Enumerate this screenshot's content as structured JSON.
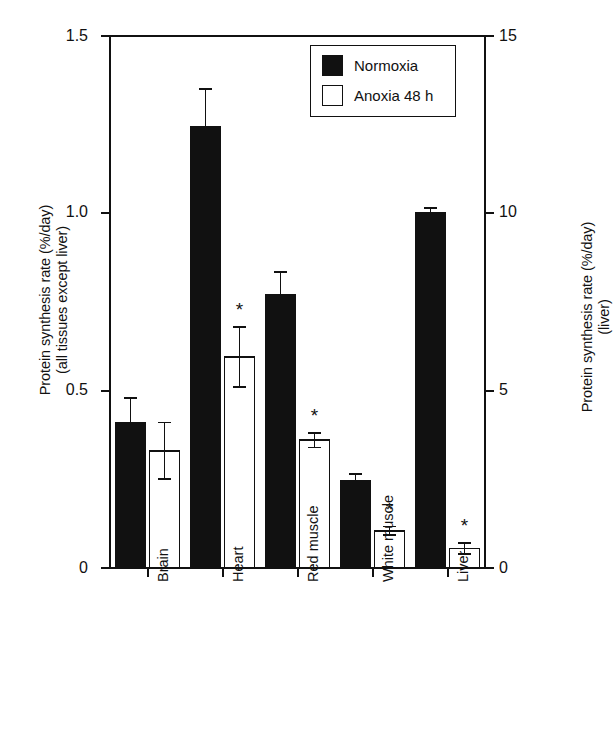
{
  "chart_data": {
    "type": "bar",
    "title": "",
    "categories": [
      "Brain",
      "Heart",
      "Red muscle",
      "White muscle",
      "Liver"
    ],
    "series": [
      {
        "name": "Normoxia",
        "color": "#111111",
        "fill": "solid",
        "values": [
          0.41,
          1.245,
          0.77,
          0.245,
          1.0
        ],
        "errors": [
          0.07,
          0.105,
          0.065,
          0.02,
          0.015
        ],
        "significant": [
          false,
          false,
          false,
          false,
          false
        ]
      },
      {
        "name": "Anoxia 48 h",
        "color": "#ffffff",
        "fill": "open",
        "values": [
          0.33,
          0.595,
          0.36,
          0.105,
          0.055
        ],
        "errors": [
          0.08,
          0.085,
          0.02,
          0.012,
          0.015
        ],
        "significant": [
          false,
          true,
          true,
          true,
          true
        ]
      }
    ],
    "ylabel": "Protein synthesis rate (%/day) (all tissues except liver)",
    "ylabel_line1": "Protein synthesis rate (%/day)",
    "ylabel_line2": "(all tissues except liver)",
    "ylabel_right": "Protein synthesis rate (%/day) (liver)",
    "ylabel_right_line1": "Protein synthesis rate (%/day)",
    "ylabel_right_line2": "(liver)",
    "xlabel": "",
    "ylim": [
      0,
      1.5
    ],
    "yticks": [
      0,
      0.5,
      1.0,
      1.5
    ],
    "ytick_labels": [
      "0",
      "0.5",
      "1.0",
      "1.5"
    ],
    "ylim_right": [
      0,
      15
    ],
    "yticks_right": [
      0,
      5,
      10,
      15
    ],
    "ytick_labels_right": [
      "0",
      "5",
      "10",
      "15"
    ],
    "grid": false,
    "legend_position": "top-right",
    "significance_marker": "*",
    "error_bar_type": "symmetric",
    "liver_scale_factor": 10,
    "note": "Liver bars are plotted on the right-hand axis (0-15 %/day); all other tissues use the left-hand axis (0-1.5 %/day)."
  },
  "legend": {
    "items": [
      {
        "label": "Normoxia",
        "swatch": "filled-square-icon"
      },
      {
        "label": "Anoxia 48 h",
        "swatch": "open-square-icon"
      }
    ]
  },
  "axes": {
    "left_tick_0": "0",
    "left_tick_05": "0.5",
    "left_tick_10": "1.0",
    "left_tick_15": "1.5",
    "right_tick_0": "0",
    "right_tick_5": "5",
    "right_tick_10": "10",
    "right_tick_15": "15"
  },
  "colors": {
    "ink": "#111111",
    "paper": "#ffffff",
    "bar_normoxia": "#111111",
    "bar_anoxia": "#ffffff"
  }
}
